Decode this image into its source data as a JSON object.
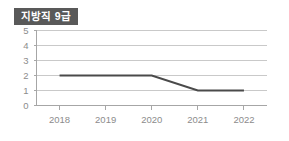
{
  "badge": {
    "label": "지방직 9급",
    "background": "#595959",
    "text_color": "#ffffff"
  },
  "chart_data": {
    "type": "line",
    "title": "지방직 9급",
    "categories": [
      "2018",
      "2019",
      "2020",
      "2021",
      "2022"
    ],
    "x": [
      2018,
      2019,
      2020,
      2021,
      2022
    ],
    "values": [
      2,
      2,
      2,
      1,
      1
    ],
    "series": [
      {
        "name": "지방직 9급",
        "values": [
          2,
          2,
          2,
          1,
          1
        ],
        "color": "#4a4a4a"
      }
    ],
    "xlabel": "",
    "ylabel": "",
    "ylim": [
      0,
      5
    ],
    "yticks": [
      0,
      1,
      2,
      3,
      4,
      5
    ],
    "ytick_labels": [
      "0",
      "1",
      "2",
      "3",
      "4",
      "5"
    ],
    "xtick_labels": [
      "2018",
      "2019",
      "2020",
      "2021",
      "2022"
    ],
    "grid": true,
    "grid_axis": "y",
    "grid_color": "#c9c9c9",
    "axis_color": "#a6a6a6",
    "legend": false,
    "markers": false,
    "background": "#ffffff"
  }
}
